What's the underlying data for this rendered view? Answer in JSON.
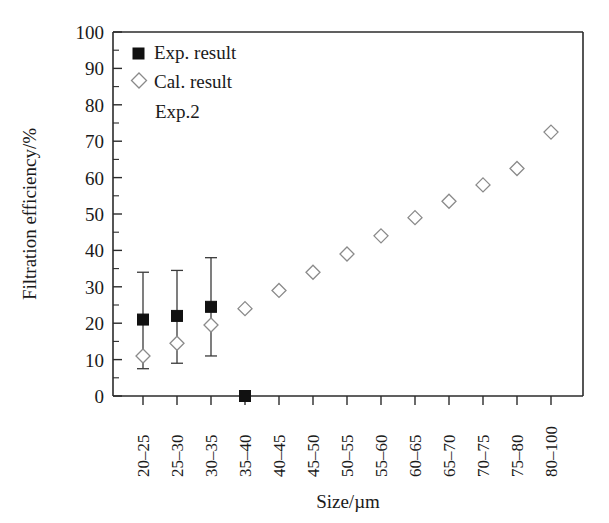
{
  "chart_data": {
    "type": "scatter",
    "title": "",
    "xlabel": "Size/µm",
    "ylabel": "Filtration efficiency/%",
    "categories": [
      "20–25",
      "25–30",
      "30–35",
      "35–40",
      "40–45",
      "45–50",
      "50–55",
      "55–60",
      "60–65",
      "65–70",
      "70–75",
      "75–80",
      "80–100"
    ],
    "ylim": [
      0,
      100
    ],
    "ytick_labels": [
      "0",
      "10",
      "20",
      "30",
      "40",
      "50",
      "60",
      "70",
      "80",
      "90",
      "100"
    ],
    "ytick_values": [
      0,
      10,
      20,
      30,
      40,
      50,
      60,
      70,
      80,
      90,
      100
    ],
    "minor_tick_step": 5,
    "grid": false,
    "legend_position": "top-left",
    "annotation": "Exp.2",
    "series": [
      {
        "name": "Exp. result",
        "marker": "filled-square",
        "color": "#111111",
        "values": [
          21.0,
          22.0,
          24.5,
          0.0,
          null,
          null,
          null,
          null,
          null,
          null,
          null,
          null,
          null
        ],
        "errors_low": [
          13.5,
          13.0,
          13.5,
          null,
          null,
          null,
          null,
          null,
          null,
          null,
          null,
          null,
          null
        ],
        "errors_high": [
          13.0,
          12.5,
          13.5,
          null,
          null,
          null,
          null,
          null,
          null,
          null,
          null,
          null,
          null
        ]
      },
      {
        "name": "Cal. result",
        "marker": "open-diamond",
        "color": "#8a8a8a",
        "values": [
          11.0,
          14.5,
          19.5,
          24.0,
          29.0,
          34.0,
          39.0,
          44.0,
          49.0,
          53.5,
          58.0,
          62.5,
          72.5
        ]
      }
    ]
  },
  "legend": {
    "items": [
      {
        "label": "Exp. result",
        "marker": "filled-square"
      },
      {
        "label": "Cal. result",
        "marker": "open-diamond"
      }
    ],
    "note": "Exp.2"
  }
}
